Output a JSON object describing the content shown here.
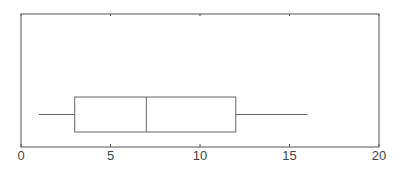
{
  "chart_data": {
    "type": "boxplot",
    "title": "",
    "xlabel": "",
    "ylabel": "",
    "orientation": "horizontal",
    "xlim": [
      0,
      20
    ],
    "xticks": [
      0,
      5,
      10,
      15,
      20
    ],
    "xtick_labels": [
      "0",
      "5",
      "10",
      "15",
      "20"
    ],
    "grid": false,
    "legend": null,
    "series": [
      {
        "name": "",
        "whisker_low": 1,
        "q1": 3,
        "median": 7,
        "q3": 12,
        "whisker_high": 16
      }
    ]
  },
  "colors": {
    "frame": "#555555",
    "box": "#666666",
    "text": "#444444"
  }
}
